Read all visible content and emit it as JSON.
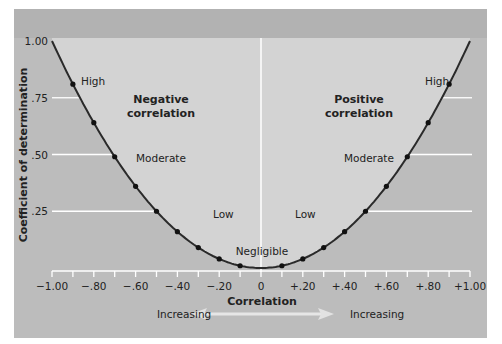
{
  "chart_data": {
    "type": "line",
    "title": "",
    "xlabel": "Correlation",
    "ylabel": "Coefficient of determination",
    "xlim": [
      -1.0,
      1.0
    ],
    "ylim": [
      0,
      1.0
    ],
    "grid": false,
    "x_tick_labels": [
      "−1.00",
      "−.80",
      "−.60",
      "−.40",
      "−.20",
      "0",
      "+.20",
      "+.40",
      "+.60",
      "+.80",
      "+1.00"
    ],
    "x_tick_values": [
      -1.0,
      -0.8,
      -0.6,
      -0.4,
      -0.2,
      0,
      0.2,
      0.4,
      0.6,
      0.8,
      1.0
    ],
    "y_tick_labels": [
      ".25",
      ".50",
      ".75",
      "1.00"
    ],
    "y_tick_values": [
      0.25,
      0.5,
      0.75,
      1.0
    ],
    "series": [
      {
        "name": "r squared",
        "x": [
          -0.9,
          -0.8,
          -0.7,
          -0.6,
          -0.5,
          -0.4,
          -0.3,
          -0.2,
          -0.1,
          0.1,
          0.2,
          0.3,
          0.4,
          0.5,
          0.6,
          0.7,
          0.8,
          0.9
        ],
        "y": [
          0.81,
          0.64,
          0.49,
          0.36,
          0.25,
          0.16,
          0.09,
          0.04,
          0.01,
          0.01,
          0.04,
          0.09,
          0.16,
          0.25,
          0.36,
          0.49,
          0.64,
          0.81
        ]
      }
    ],
    "annotations": {
      "negative": "Negative correlation",
      "negative_line1": "Negative",
      "negative_line2": "correlation",
      "positive_line1": "Positive",
      "positive_line2": "correlation",
      "high_left": "High",
      "high_right": "High",
      "moderate_left": "Moderate",
      "moderate_right": "Moderate",
      "low_left": "Low",
      "low_right": "Low",
      "negligible": "Negligible",
      "increasing_left": "Increasing",
      "increasing_right": "Increasing"
    },
    "colors": {
      "panel_outer": "#bcbcbc",
      "panel_top_band": "#b2b2b2",
      "panel_inner": "#d3d3d3",
      "curve": "#2a2a2a",
      "guide_lines": "#ffffff"
    }
  }
}
